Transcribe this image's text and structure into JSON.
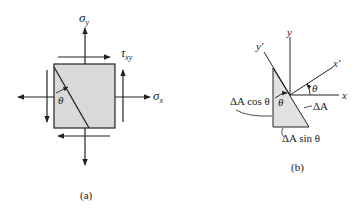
{
  "panel_a": {
    "caption": "(a)",
    "labels": {
      "sigma_y": "σ",
      "sigma_y_sub": "y",
      "tau_xy": "τ",
      "tau_xy_sub": "xy",
      "sigma_x": "σ",
      "sigma_x_sub": "x",
      "theta": "θ"
    },
    "colors": {
      "element_fill": "#d9d9d9",
      "stroke": "#222222"
    }
  },
  "panel_b": {
    "caption": "(b)",
    "labels": {
      "y_axis": "y",
      "y_prime": "y′",
      "x_axis": "x",
      "x_prime": "x′",
      "theta_axes": "θ",
      "theta_wedge": "θ",
      "dA_cos": "ΔA cos θ",
      "dA": "ΔA",
      "dA_sin": "ΔA sin θ"
    },
    "colors": {
      "wedge_fill": "#e2e2e2",
      "stroke": "#222222"
    }
  }
}
